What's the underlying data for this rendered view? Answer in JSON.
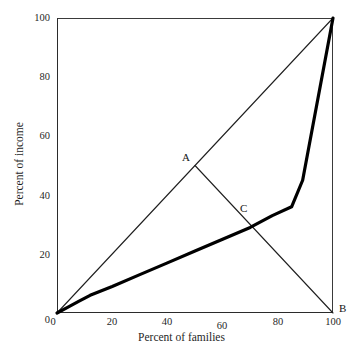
{
  "chart_data": {
    "type": "line",
    "title": "",
    "xlabel": "Percent of families",
    "ylabel": "Percent of income",
    "xlim": [
      0,
      100
    ],
    "ylim": [
      0,
      100
    ],
    "grid": false,
    "legend": "none",
    "xticks": [
      0,
      20,
      40,
      60,
      80,
      100
    ],
    "yticks": [
      0,
      20,
      40,
      60,
      80,
      100
    ],
    "xtick_labels": [
      "0",
      "20",
      "40",
      "60",
      "80",
      "100"
    ],
    "ytick_labels": [
      "0",
      "20",
      "40",
      "60",
      "80",
      "100"
    ],
    "series": [
      {
        "name": "line of equality",
        "style": "thin",
        "x": [
          0,
          100
        ],
        "y": [
          0,
          100
        ]
      },
      {
        "name": "Lorenz curve",
        "style": "thick",
        "x": [
          0,
          4,
          8,
          12,
          20,
          30,
          40,
          50,
          60,
          70,
          78,
          85,
          89,
          100
        ],
        "y": [
          0,
          2,
          4,
          6,
          9,
          13,
          17,
          21,
          25,
          29,
          33,
          36,
          45,
          100
        ]
      },
      {
        "name": "chord A to B",
        "style": "thin",
        "x": [
          50,
          100
        ],
        "y": [
          50,
          0
        ]
      }
    ],
    "annotations": [
      {
        "label": "A",
        "x": 50,
        "y": 50,
        "anchor": "upper-left"
      },
      {
        "label": "C",
        "x": 70,
        "y": 30,
        "anchor": "upper-left"
      },
      {
        "label": "B",
        "x": 100,
        "y": 0,
        "anchor": "right"
      }
    ]
  },
  "colors": {
    "background": "#ffffff",
    "ink": "#1a1a1a",
    "axis": "#2b2b2b",
    "thin_line": "#1f1f1f",
    "thick_line": "#000000"
  }
}
